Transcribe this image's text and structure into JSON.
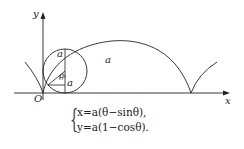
{
  "diagram": {
    "type": "cycloid",
    "labels": {
      "y_axis": "y",
      "x_axis": "x",
      "origin": "O",
      "radius_top": "a",
      "radius_bottom": "a",
      "angle": "θ",
      "arch_label": "a"
    },
    "equations": {
      "line1": "x=a(θ−sinθ),",
      "line2": "y=a(1−cosθ)."
    },
    "colors": {
      "stroke": "#222222",
      "background": "#ffffff"
    }
  }
}
